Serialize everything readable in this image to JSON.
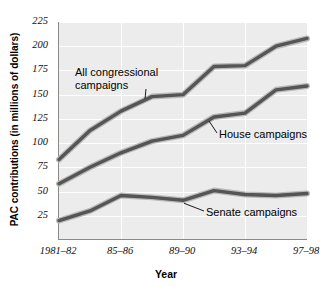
{
  "chart_data": {
    "type": "line",
    "title": "",
    "xlabel": "Year",
    "ylabel": "PAC contributions (in millions of dollars)",
    "categories": [
      "1981–82",
      "83–84",
      "85–86",
      "87–88",
      "89–90",
      "91–92",
      "93–94",
      "95–96",
      "97–98"
    ],
    "xtick_labels": [
      "1981–82",
      "85–86",
      "89–90",
      "93–94",
      "97–98"
    ],
    "xtick_indices": [
      0,
      2,
      4,
      6,
      8
    ],
    "ytick_labels": [
      "25",
      "50",
      "75",
      "100",
      "125",
      "150",
      "175",
      "200",
      "225"
    ],
    "ytick_values": [
      25,
      50,
      75,
      100,
      125,
      150,
      175,
      200,
      225
    ],
    "ylim": [
      0,
      225
    ],
    "grid": true,
    "legend_position": "inline-annotations",
    "plot_background": "#ececec",
    "gridline_color": "#ffffff",
    "line_color": "#555555",
    "series": [
      {
        "name": "All congressional campaigns",
        "label": "All congressional\ncampaigns",
        "values": [
          83,
          113,
          133,
          148,
          150,
          179,
          180,
          200,
          208
        ]
      },
      {
        "name": "House campaigns",
        "label": "House campaigns",
        "values": [
          58,
          75,
          90,
          102,
          108,
          127,
          131,
          155,
          159
        ]
      },
      {
        "name": "Senate campaigns",
        "label": "Senate campaigns",
        "values": [
          20,
          30,
          46,
          44,
          41,
          51,
          47,
          46,
          48
        ]
      }
    ],
    "annotations": [
      {
        "name": "all-congressional-label",
        "line1": "All congressional",
        "line2": "campaigns"
      },
      {
        "name": "house-label",
        "line1": "House campaigns",
        "line2": ""
      },
      {
        "name": "senate-label",
        "line1": "Senate campaigns",
        "line2": ""
      }
    ]
  }
}
